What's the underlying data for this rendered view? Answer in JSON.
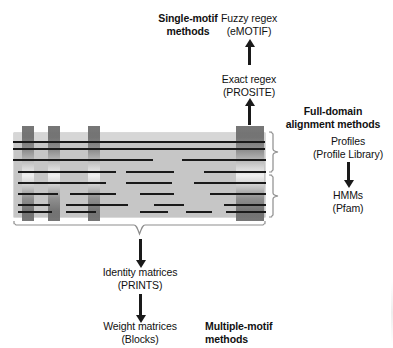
{
  "figure": {
    "type": "diagram"
  },
  "labels": {
    "single_motif_methods": "Single-motif\nmethods",
    "fuzzy_regex": "Fuzzy regex\n(eMOTIF)",
    "exact_regex": "Exact regex\n(PROSITE)",
    "full_domain_methods": "Full-domain\nalignment methods",
    "profiles": "Profiles\n(Profile Library)",
    "hmms": "HMMs\n(Pfam)",
    "identity_matrices": "Identity matrices\n(PRINTS)",
    "weight_matrices": "Weight matrices\n(Blocks)",
    "multiple_motif_methods": "Multiple-motif\nmethods"
  },
  "alignment_block": {
    "name": "multiple-sequence-alignment",
    "background_color": "#c6c6c6",
    "top_strip_color": "#d6d6d6",
    "motif_columns": [
      {
        "id": "motif-1",
        "left": 8,
        "width": 12,
        "kind": "narrow"
      },
      {
        "id": "motif-2",
        "left": 34,
        "width": 12,
        "kind": "narrow"
      },
      {
        "id": "motif-3",
        "left": 74,
        "width": 12,
        "kind": "narrow"
      },
      {
        "id": "motif-4",
        "left": 222,
        "width": 28,
        "kind": "wide-domain"
      }
    ],
    "sequence_rows": 8
  },
  "colors": {
    "block_fill": "#c6c6c6",
    "motif_bar_dark": "#6f6f6f",
    "motif_bar_light": "#f2f2f2",
    "sequence_line": "#1a1a1a",
    "brace": "#8d8d8d",
    "text": "#111111"
  },
  "flows": [
    {
      "id": "flow-exact-to-fuzzy",
      "from": "Exact regex (PROSITE)",
      "to": "Fuzzy regex (eMOTIF)",
      "direction": "up"
    },
    {
      "id": "flow-block-to-exact",
      "from": "alignment block motif",
      "to": "Exact regex (PROSITE)",
      "direction": "up"
    },
    {
      "id": "flow-profiles-to-hmms",
      "from": "Profiles (Profile Library)",
      "to": "HMMs (Pfam)",
      "direction": "down"
    },
    {
      "id": "flow-block-to-identity",
      "from": "alignment block",
      "to": "Identity matrices (PRINTS)",
      "direction": "down"
    },
    {
      "id": "flow-identity-to-weight",
      "from": "Identity matrices (PRINTS)",
      "to": "Weight matrices (Blocks)",
      "direction": "down"
    }
  ]
}
